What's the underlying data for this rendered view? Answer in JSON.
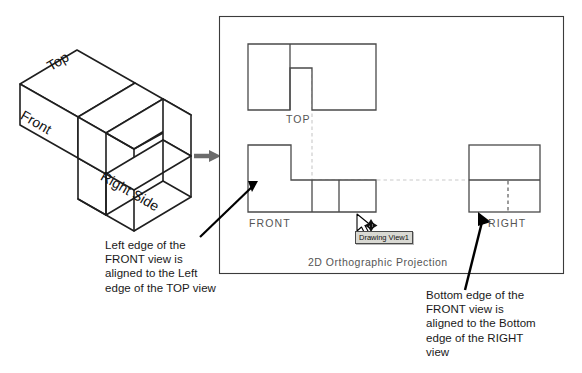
{
  "figure": {
    "title_caption": "2D Orthographic Projection",
    "isometric": {
      "face_labels": [
        {
          "name": "top",
          "text": "Top"
        },
        {
          "name": "front",
          "text": "Front"
        },
        {
          "name": "right-side",
          "text": "Right Side"
        }
      ]
    },
    "projection_panel": {
      "border_color": "#3b3b3b",
      "background": "#ffffff",
      "views": [
        {
          "name": "top",
          "label": "TOP"
        },
        {
          "name": "front",
          "label": "FRONT"
        },
        {
          "name": "right",
          "label": "RIGHT"
        }
      ],
      "tooltip": {
        "text": "Drawing View1",
        "background": "#d9d9d3",
        "border": "#4a4a4a"
      },
      "cursor": {
        "name": "move-cursor",
        "visible": true
      },
      "construction_line_color": "#c9c9c9"
    },
    "annotations": [
      {
        "name": "left-alignment-note",
        "text": "Left edge of the\nFRONT view is\naligned to the Left\nedge of the TOP view"
      },
      {
        "name": "right-alignment-note",
        "text": "Bottom edge of the\nFRONT view is\naligned to the Bottom\nedge of the RIGHT\nview"
      }
    ],
    "arrows": [
      {
        "name": "iso-to-projection-arrow",
        "color": "#6b6b6b"
      },
      {
        "name": "left-note-arrow",
        "color": "#000000"
      },
      {
        "name": "right-note-arrow",
        "color": "#000000"
      }
    ],
    "colors": {
      "line": "#3b3b3b",
      "text": "#1a1a1a",
      "label": "#555555",
      "hidden_line": "#4a4a4a",
      "construction": "#c9c9c9"
    }
  }
}
